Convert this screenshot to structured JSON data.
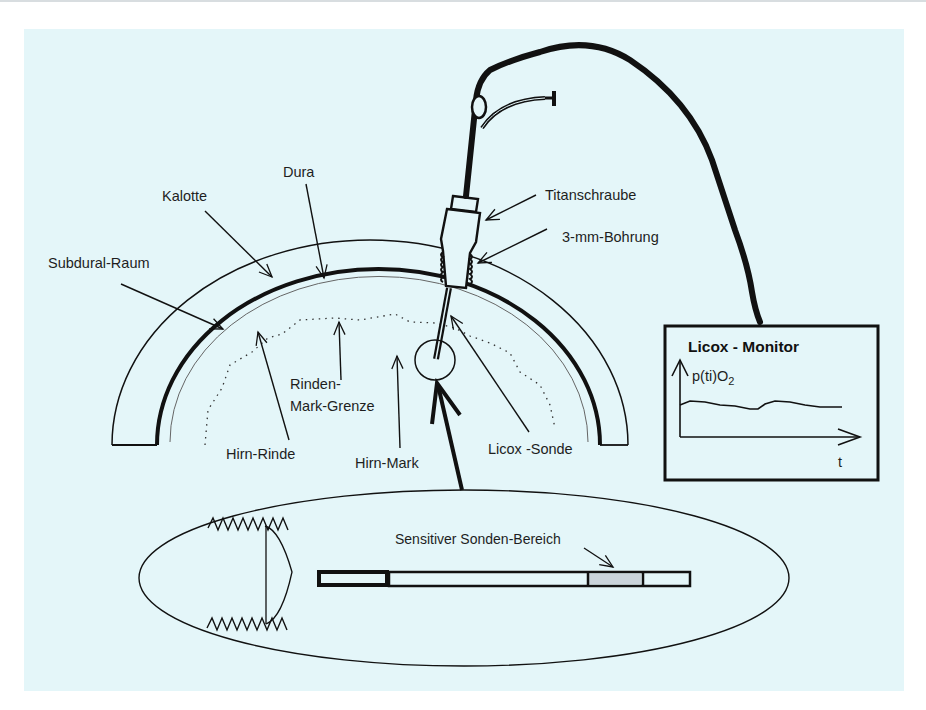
{
  "figure": {
    "background_color": "#e4f6f9",
    "line_color": "#111111",
    "sensitive_region_color": "#c9d3da"
  },
  "labels": {
    "dura": "Dura",
    "kalotte": "Kalotte",
    "subdural_raum": "Subdural-Raum",
    "titanschraube": "Titanschraube",
    "bohrung": "3-mm-Bohrung",
    "rinden_mark_grenze_line1": "Rinden-",
    "rinden_mark_grenze_line2": "Mark-Grenze",
    "hirn_rinde": "Hirn-Rinde",
    "hirn_mark": "Hirn-Mark",
    "licox_sonde": "Licox -Sonde",
    "sensitiver_bereich": "Sensitiver Sonden-Bereich"
  },
  "monitor": {
    "title": "Licox  - Monitor",
    "y_axis_label_main": "p(ti)O",
    "y_axis_label_sub": "2",
    "x_axis_label": "t"
  }
}
